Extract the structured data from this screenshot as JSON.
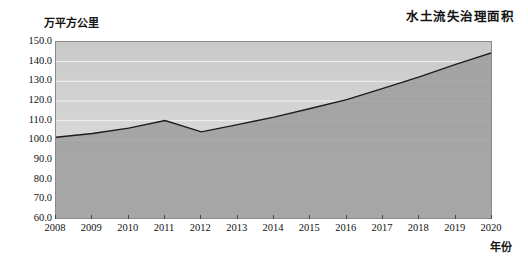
{
  "chart_data": {
    "type": "area",
    "title": "水土流失治理面积",
    "xlabel": "年份",
    "ylabel": "万平方公里",
    "categories": [
      "2008",
      "2009",
      "2010",
      "2011",
      "2012",
      "2013",
      "2014",
      "2015",
      "2016",
      "2017",
      "2018",
      "2019",
      "2020"
    ],
    "values": [
      101.6,
      103.5,
      106.2,
      110.1,
      104.3,
      108.0,
      111.8,
      116.2,
      120.7,
      126.4,
      132.3,
      138.6,
      144.6
    ],
    "ylim": [
      60.0,
      150.0
    ],
    "ytick_labels": [
      "150.0",
      "140.0",
      "130.0",
      "120.0",
      "110.0",
      "100.0",
      "90.0",
      "80.0",
      "70.0",
      "60.0"
    ],
    "ytick_values": [
      150.0,
      140.0,
      130.0,
      120.0,
      110.0,
      100.0,
      90.0,
      80.0,
      70.0,
      60.0
    ],
    "grid": true,
    "legend": "none",
    "series_name": "水土流失治理面积"
  },
  "colors": {
    "area_fill": "#9a9a9a",
    "plot_background_top": "#c9c9c9",
    "plot_background_bottom": "#e3e3e3",
    "line": "#1c1c1c",
    "gridline": "#f2f2f2",
    "axis": "#8a8a8a",
    "text": "#141414"
  }
}
